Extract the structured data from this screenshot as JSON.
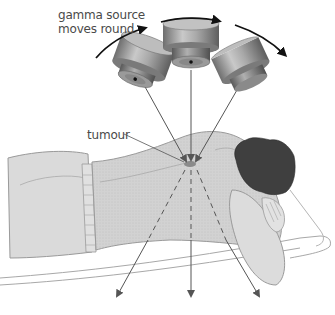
{
  "diagram": {
    "labels": {
      "source_line1": "gamma source",
      "source_line2": "moves round",
      "tumour": "tumour"
    },
    "elements": {
      "sources": [
        "gamma-source-left",
        "gamma-source-centre",
        "gamma-source-right"
      ],
      "motion_arrows": 3,
      "beams_converge_on": "tumour",
      "exit_beams": 3
    },
    "colors": {
      "background": "#ffffff",
      "body": "#d6d6d6",
      "body_outline": "#9a9a9a",
      "hair": "#3f3f3f",
      "beam": "#555555",
      "source_metal": "#8c8c8c",
      "tumour": "#8a8a8a",
      "text": "#4a4a4a"
    }
  }
}
